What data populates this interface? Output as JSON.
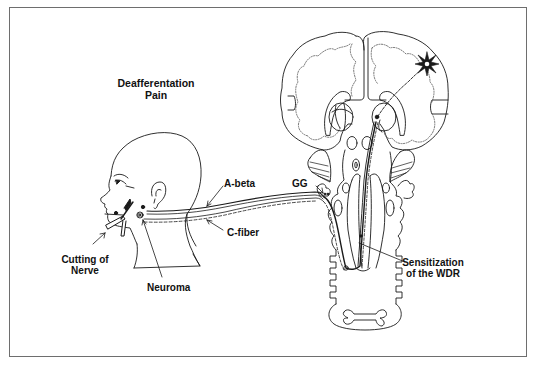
{
  "diagram": {
    "title_line1": "Deafferentation",
    "title_line2": "Pain",
    "labels": {
      "a_beta": "A-beta",
      "c_fiber": "C-fiber",
      "cutting_line1": "Cutting of",
      "cutting_line2": "Nerve",
      "neuroma": "Neuroma",
      "gg": "GG",
      "wdr_line1": "Sensitization",
      "wdr_line2": "of the WDR"
    },
    "colors": {
      "line": "#1a1a1a",
      "frame": "#6e6e6e",
      "dotted": "#555555",
      "background": "#ffffff"
    }
  }
}
